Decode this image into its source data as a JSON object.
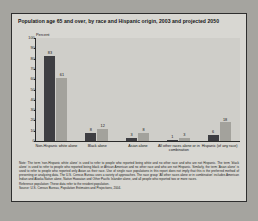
{
  "figure": {
    "title": "Population age 65 and over, by race and Hispanic origin, 2003 and projected 2050",
    "axis_unit": "Percent",
    "note": "Note: The term ‘non-Hispanic white alone’ is used to refer to people who reported being white and no other race and who are not Hispanic. The term ‘black alone’ is used to refer to people who reported being black or African American and no other race and who are not Hispanic. Similarly, the term ‘Asian alone’ is used to refer to people who reported only Asian as their race. Use of single race populations in this report does not imply that this is the preferred method of presenting or analyzing data. The U.S. Census Bureau uses a variety of approaches. The race group ‘All other races alone or in combination’ includes American Indian and Alaska Native alone, Native Hawaiian and Other Pacific Islander alone, and all people who reported two or more races.",
    "reference_population": "Reference population: These data refer to the resident population.",
    "source": "Source: U.S. Census Bureau, Population Estimates and Projections, 2004."
  },
  "chart_data": {
    "type": "bar",
    "title": "Population age 65 and over, by race and Hispanic origin, 2003 and projected 2050",
    "xlabel": "",
    "ylabel": "Percent",
    "ylim": [
      0,
      100
    ],
    "yticks": [
      0,
      10,
      20,
      30,
      40,
      50,
      60,
      70,
      80,
      90,
      100
    ],
    "grid": false,
    "legend_position": "top-right",
    "categories": [
      "Non-Hispanic white alone",
      "Black alone",
      "Asian alone",
      "All other races alone or in combination",
      "Hispanic (of any race)"
    ],
    "series": [
      {
        "name": "2003",
        "color": "#3e3e42",
        "values": [
          83,
          8,
          3,
          1,
          6
        ]
      },
      {
        "name": "2050 (projected)",
        "color": "#a3a29c",
        "values": [
          61,
          12,
          8,
          3,
          18
        ]
      }
    ]
  }
}
